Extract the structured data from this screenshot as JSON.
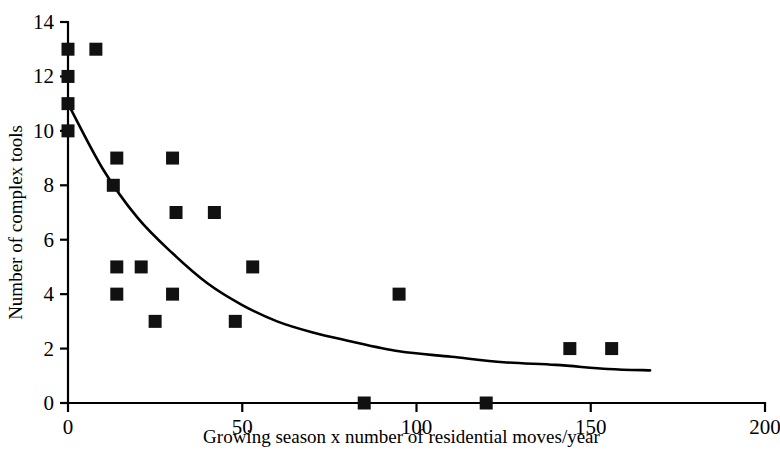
{
  "chart_data": {
    "type": "scatter",
    "title": "",
    "xlabel": "Growing season x number of residential moves/year",
    "ylabel": "Number of complex tools",
    "xlim": [
      0,
      200
    ],
    "ylim": [
      0,
      14
    ],
    "xticks": [
      0,
      50,
      100,
      150,
      200
    ],
    "yticks": [
      0,
      2,
      4,
      6,
      8,
      10,
      12,
      14
    ],
    "xtick_labels": [
      "0",
      "50",
      "100",
      "150",
      "200"
    ],
    "ytick_labels": [
      "0",
      "2",
      "4",
      "6",
      "8",
      "10",
      "12",
      "14"
    ],
    "grid": false,
    "legend": false,
    "marker": "square",
    "marker_color": "#111111",
    "points": [
      {
        "x": 0,
        "y": 13
      },
      {
        "x": 0,
        "y": 12
      },
      {
        "x": 0,
        "y": 11
      },
      {
        "x": 0,
        "y": 10
      },
      {
        "x": 8,
        "y": 13
      },
      {
        "x": 13,
        "y": 8
      },
      {
        "x": 14,
        "y": 9
      },
      {
        "x": 14,
        "y": 5
      },
      {
        "x": 14,
        "y": 4
      },
      {
        "x": 21,
        "y": 5
      },
      {
        "x": 25,
        "y": 3
      },
      {
        "x": 30,
        "y": 9
      },
      {
        "x": 30,
        "y": 4
      },
      {
        "x": 31,
        "y": 7
      },
      {
        "x": 42,
        "y": 7
      },
      {
        "x": 48,
        "y": 3
      },
      {
        "x": 53,
        "y": 5
      },
      {
        "x": 85,
        "y": 0
      },
      {
        "x": 95,
        "y": 4
      },
      {
        "x": 120,
        "y": 0
      },
      {
        "x": 144,
        "y": 2
      },
      {
        "x": 156,
        "y": 2
      }
    ],
    "fit_curve": {
      "name": "exponential decay fit",
      "description": "Decaying curve from (0, 11) flattening toward y ~ 1.2 at x = 167",
      "x_start": 0,
      "x_end": 167,
      "y_start": 11,
      "y_end": 1.2,
      "asymptote": 1.0,
      "points": [
        {
          "x": 0,
          "y": 11.0
        },
        {
          "x": 10,
          "y": 8.6
        },
        {
          "x": 20,
          "y": 6.8
        },
        {
          "x": 30,
          "y": 5.5
        },
        {
          "x": 40,
          "y": 4.4
        },
        {
          "x": 50,
          "y": 3.6
        },
        {
          "x": 60,
          "y": 3.0
        },
        {
          "x": 70,
          "y": 2.6
        },
        {
          "x": 80,
          "y": 2.3
        },
        {
          "x": 95,
          "y": 1.9
        },
        {
          "x": 110,
          "y": 1.7
        },
        {
          "x": 125,
          "y": 1.5
        },
        {
          "x": 140,
          "y": 1.4
        },
        {
          "x": 155,
          "y": 1.25
        },
        {
          "x": 167,
          "y": 1.2
        }
      ]
    }
  }
}
